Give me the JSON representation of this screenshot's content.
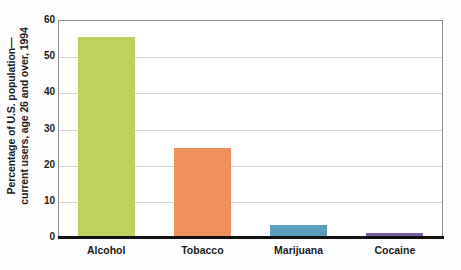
{
  "chart_data": {
    "type": "bar",
    "title": "",
    "subtitle": "",
    "xlabel": "",
    "ylabel_lines": [
      "Percentage of U.S. population—",
      "current users, age 26 and over, 1994"
    ],
    "ylabel": "Percentage of U.S. population—current users, age 26 and over, 1994",
    "categories": [
      "Alcohol",
      "Tobacco",
      "Marijuana",
      "Cocaine"
    ],
    "values": [
      55.2,
      24.7,
      3.3,
      1.0
    ],
    "colors": [
      "#bfd05e",
      "#f0905c",
      "#5b9dbb",
      "#7a5ea6"
    ],
    "ylim": [
      0,
      60
    ],
    "yticks": [
      0,
      10,
      20,
      30,
      40,
      50,
      60
    ],
    "ytick_labels": [
      "0",
      "10",
      "20",
      "30",
      "40",
      "50",
      "60"
    ],
    "grid": true,
    "grid_axis": "y",
    "legend": false,
    "legend_position": "none",
    "axis_line_color": "#8d8d8d",
    "baseline_color": "#111111",
    "gridline_color": "#d2d2d2",
    "plot_background": "#ffffff",
    "figure_background": "#fefefe"
  }
}
